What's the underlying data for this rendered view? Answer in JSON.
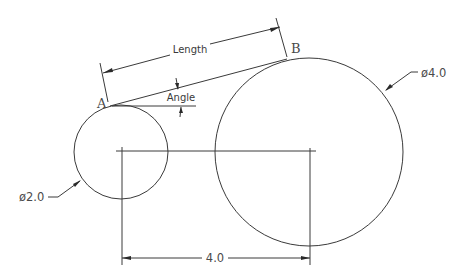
{
  "diagram": {
    "type": "technical-drawing",
    "colors": {
      "background": "#ffffff",
      "line": "#3a3a3a"
    },
    "circles": [
      {
        "id": "small",
        "cx": 121,
        "cy": 152,
        "r": 47,
        "diameter_label": "ø2.0"
      },
      {
        "id": "large",
        "cx": 309,
        "cy": 152,
        "r": 94,
        "diameter_label": "ø4.0"
      }
    ],
    "points": {
      "a_label": "A",
      "b_label": "B"
    },
    "dimensions": {
      "length_label": "Length",
      "angle_label": "Angle",
      "center_distance_label": "4.0"
    }
  }
}
